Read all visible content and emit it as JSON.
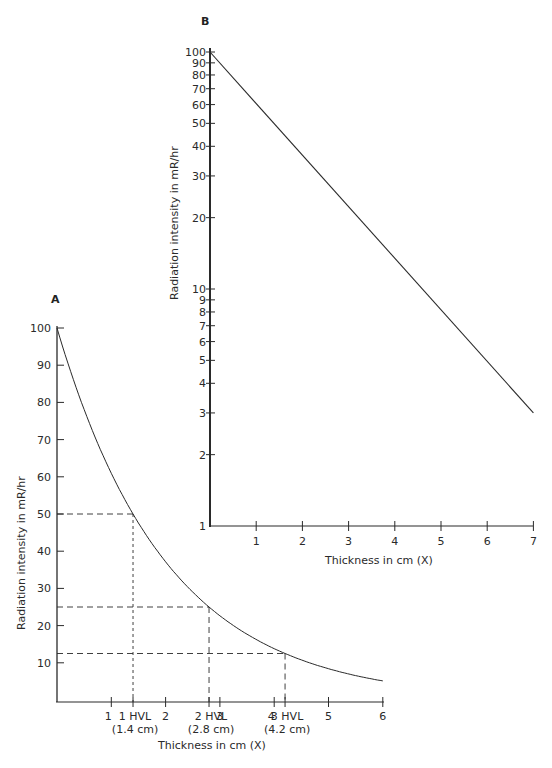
{
  "chart_data": [
    {
      "id": "A",
      "type": "line",
      "panel_label": "A",
      "title": "",
      "xlabel": "Thickness in cm (X)",
      "ylabel": "Radiation intensity in mR/hr",
      "y_scale": "linear",
      "xlim": [
        0,
        6
      ],
      "ylim": [
        0,
        100
      ],
      "x_ticks": [
        1,
        2,
        3,
        4,
        5,
        6
      ],
      "y_ticks": [
        10,
        20,
        30,
        40,
        50,
        60,
        70,
        80,
        90,
        100
      ],
      "grid": false,
      "series": [
        {
          "name": "Radiation intensity",
          "x": [
            0,
            0.25,
            0.5,
            0.75,
            1.0,
            1.4,
            2.0,
            2.5,
            2.8,
            3.0,
            3.5,
            4.0,
            4.2,
            4.5,
            5.0,
            5.5,
            6.0
          ],
          "y": [
            100,
            88,
            78,
            69,
            60,
            50,
            37,
            29,
            25,
            22,
            17.5,
            14,
            12.5,
            11,
            8.5,
            6.5,
            5
          ]
        }
      ],
      "annotations": [
        {
          "type": "hvl",
          "label": "1 HVL",
          "sublabel": "(1.4 cm)",
          "x": 1.4,
          "y": 50
        },
        {
          "type": "hvl",
          "label": "2 HVL",
          "sublabel": "(2.8 cm)",
          "x": 2.8,
          "y": 25
        },
        {
          "type": "hvl",
          "label": "3 HVL",
          "sublabel": "(4.2 cm)",
          "x": 4.2,
          "y": 12.5
        }
      ]
    },
    {
      "id": "B",
      "type": "line",
      "panel_label": "B",
      "title": "",
      "xlabel": "Thickness in cm (X)",
      "ylabel": "Radiation intensity in mR/hr",
      "y_scale": "log",
      "xlim": [
        0,
        7
      ],
      "ylim": [
        1,
        100
      ],
      "x_ticks": [
        1,
        2,
        3,
        4,
        5,
        6,
        7
      ],
      "y_ticks": [
        1,
        2,
        3,
        4,
        5,
        6,
        7,
        8,
        9,
        10,
        20,
        30,
        40,
        50,
        60,
        70,
        80,
        90,
        100
      ],
      "grid": false,
      "series": [
        {
          "name": "Radiation intensity",
          "x": [
            0,
            7
          ],
          "y": [
            100,
            3
          ]
        }
      ]
    }
  ],
  "panelA": {
    "label": "A",
    "xlabel": "Thickness in cm (X)",
    "ylabel": "Radiation intensity in mR/hr",
    "ytick_labels": [
      "100",
      "90",
      "80",
      "70",
      "60",
      "50",
      "40",
      "30",
      "20",
      "10"
    ],
    "xtick_labels": [
      "1",
      "2",
      "3",
      "4",
      "5",
      "6"
    ],
    "hvl": [
      {
        "label": "1 HVL",
        "sub": "(1.4 cm)"
      },
      {
        "label": "2 HVL",
        "sub": "(2.8 cm)"
      },
      {
        "label": "3 HVL",
        "sub": "(4.2 cm)"
      }
    ]
  },
  "panelB": {
    "label": "B",
    "xlabel": "Thickness in cm (X)",
    "ylabel": "Radiation intensity in mR/hr",
    "ytick_labels": [
      "100",
      "90",
      "80",
      "70",
      "60",
      "50",
      "40",
      "30",
      "20",
      "10",
      "9",
      "8",
      "7",
      "6",
      "5",
      "4",
      "3",
      "2",
      "1"
    ],
    "xtick_labels": [
      "1",
      "2",
      "3",
      "4",
      "5",
      "6",
      "7"
    ]
  },
  "style": {
    "ink": "#2a2a2a",
    "background": "#ffffff"
  }
}
